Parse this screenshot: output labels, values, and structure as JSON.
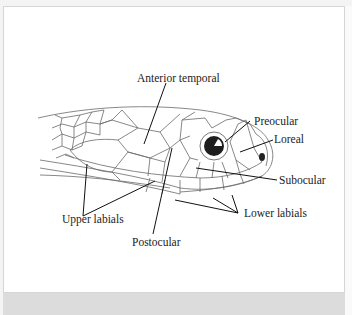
{
  "figure": {
    "labels": {
      "anterior_temporal": "Anterior temporal",
      "preocular": "Preocular",
      "loreal": "Loreal",
      "subocular": "Subocular",
      "upper_labials": "Upper labials",
      "lower_labials": "Lower labials",
      "postocular": "Postocular"
    }
  },
  "colors": {
    "line": "#555555",
    "leader": "#111111",
    "eye": "#222222",
    "background": "#ffffff",
    "bottom_bar": "#dcdcdc"
  }
}
